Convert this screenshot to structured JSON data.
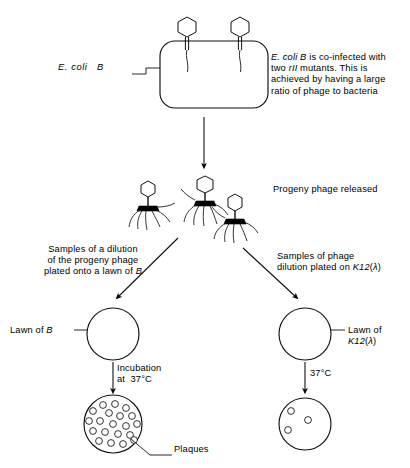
{
  "diagram": {
    "colors": {
      "ink": "#000000",
      "background": "#ffffff",
      "baseplate": "#000000"
    }
  },
  "top_stage": {
    "cell_label": "E. coli   B",
    "cell_label_italic_part": "E. coli",
    "cell_label_plain_part": "B",
    "annotation": "E. coli B is co-infected with two rII mutants. This is achieved by having a large ratio of phage to bacteria",
    "annotation_lines": [
      "E. coli B is co-infected with",
      "two rII mutants. This is",
      "achieved by having a large",
      "ratio of phage to bacteria"
    ],
    "infecting_phage_count": 2
  },
  "middle_stage": {
    "progeny_label": "Progeny phage released",
    "progeny_phage_count": 3
  },
  "branches": {
    "left": {
      "instruction_lines": [
        "Samples of a dilution",
        "of the progeny phage",
        "plated onto a lawn of B"
      ],
      "plate_label_lines": [
        "Lawn of B"
      ],
      "plate_label": "Lawn of B",
      "incubation_lines": [
        "Incubation",
        "at 37°C"
      ],
      "incubation": "Incubation at 37°C",
      "temperature": "37°C",
      "result_plaque_count": 20,
      "result_label": "Plaques"
    },
    "right": {
      "instruction_lines": [
        "Samples of phage",
        "dilution plated on K12(λ)"
      ],
      "plate_label_lines": [
        "Lawn of",
        "K12(λ)"
      ],
      "plate_label": "Lawn of K12(λ)",
      "temperature": "37°C",
      "result_plaque_count": 3
    }
  }
}
